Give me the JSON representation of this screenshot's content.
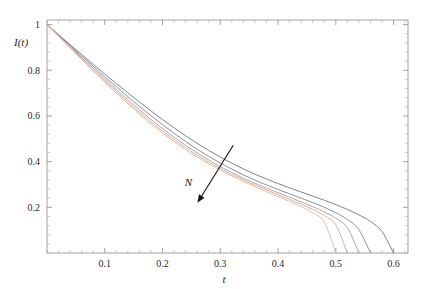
{
  "chart_data": {
    "type": "line",
    "title": "",
    "subtitle": "",
    "xlabel": "t",
    "ylabel": "I(t)",
    "xlim": [
      0,
      0.625
    ],
    "ylim": [
      0,
      1.02
    ],
    "grid": false,
    "legend": null,
    "legend_position": "none",
    "xticks": [
      0.1,
      0.2,
      0.3,
      0.4,
      0.5,
      0.6
    ],
    "xtick_labels": [
      "0.1",
      "0.2",
      "0.3",
      "0.4",
      "0.5",
      "0.6"
    ],
    "yticks": [
      0.2,
      0.4,
      0.6,
      0.8,
      1.0
    ],
    "ytick_labels": [
      "0.2",
      "0.4",
      "0.6",
      "0.8",
      "1"
    ],
    "x_minor_tick_step": 0.02,
    "y_minor_tick_step": 0.04,
    "annotations": [
      {
        "text": "N",
        "kind": "arrow-label",
        "label_x": 0.245,
        "label_y": 0.292,
        "arrow_from_x": 0.3225,
        "arrow_from_y": 0.472,
        "arrow_to_x": 0.2605,
        "arrow_to_y": 0.2195
      }
    ],
    "series": [
      {
        "name": "N-1",
        "color": "#6a7590",
        "x": [
          0,
          0.02,
          0.04,
          0.06,
          0.08,
          0.1,
          0.12,
          0.14,
          0.16,
          0.18,
          0.2,
          0.22,
          0.24,
          0.26,
          0.28,
          0.3,
          0.32,
          0.34,
          0.36,
          0.38,
          0.4,
          0.42,
          0.44,
          0.46,
          0.48,
          0.5,
          0.52,
          0.54,
          0.56,
          0.58,
          0.6
        ],
        "y": [
          1.0,
          0.956,
          0.912,
          0.869,
          0.826,
          0.784,
          0.742,
          0.701,
          0.661,
          0.622,
          0.584,
          0.548,
          0.513,
          0.48,
          0.449,
          0.42,
          0.393,
          0.368,
          0.345,
          0.324,
          0.304,
          0.285,
          0.267,
          0.249,
          0.231,
          0.212,
          0.191,
          0.167,
          0.138,
          0.094,
          0.0
        ]
      },
      {
        "name": "N-2",
        "color": "#7e8297",
        "x": [
          0,
          0.02,
          0.04,
          0.06,
          0.08,
          0.1,
          0.12,
          0.14,
          0.16,
          0.18,
          0.2,
          0.22,
          0.24,
          0.26,
          0.28,
          0.3,
          0.32,
          0.34,
          0.36,
          0.38,
          0.4,
          0.42,
          0.44,
          0.46,
          0.48,
          0.5,
          0.52,
          0.54,
          0.56
        ],
        "y": [
          1.0,
          0.954,
          0.908,
          0.862,
          0.817,
          0.772,
          0.728,
          0.684,
          0.642,
          0.601,
          0.562,
          0.524,
          0.488,
          0.454,
          0.423,
          0.394,
          0.367,
          0.342,
          0.319,
          0.298,
          0.278,
          0.259,
          0.24,
          0.221,
          0.2,
          0.176,
          0.147,
          0.102,
          0.0
        ]
      },
      {
        "name": "N-3",
        "color": "#b09a92",
        "x": [
          0,
          0.02,
          0.04,
          0.06,
          0.08,
          0.1,
          0.12,
          0.14,
          0.16,
          0.18,
          0.2,
          0.22,
          0.24,
          0.26,
          0.28,
          0.3,
          0.32,
          0.34,
          0.36,
          0.38,
          0.4,
          0.42,
          0.44,
          0.46,
          0.48,
          0.5,
          0.52,
          0.54
        ],
        "y": [
          1.0,
          0.952,
          0.904,
          0.856,
          0.809,
          0.762,
          0.716,
          0.671,
          0.627,
          0.585,
          0.545,
          0.507,
          0.471,
          0.438,
          0.407,
          0.378,
          0.352,
          0.327,
          0.305,
          0.284,
          0.264,
          0.244,
          0.224,
          0.203,
          0.18,
          0.152,
          0.111,
          0.0
        ]
      },
      {
        "name": "N-4",
        "color": "#cfa894",
        "x": [
          0,
          0.02,
          0.04,
          0.06,
          0.08,
          0.1,
          0.12,
          0.14,
          0.16,
          0.18,
          0.2,
          0.22,
          0.24,
          0.26,
          0.28,
          0.3,
          0.32,
          0.34,
          0.36,
          0.38,
          0.4,
          0.42,
          0.44,
          0.46,
          0.48,
          0.5,
          0.52
        ],
        "y": [
          1.0,
          0.95,
          0.9,
          0.851,
          0.802,
          0.754,
          0.707,
          0.661,
          0.616,
          0.574,
          0.534,
          0.496,
          0.461,
          0.428,
          0.398,
          0.37,
          0.344,
          0.32,
          0.297,
          0.276,
          0.255,
          0.235,
          0.214,
          0.191,
          0.164,
          0.123,
          0.0
        ]
      },
      {
        "name": "N-5",
        "color": "#e0b49c",
        "x": [
          0,
          0.02,
          0.04,
          0.06,
          0.08,
          0.1,
          0.12,
          0.14,
          0.16,
          0.18,
          0.2,
          0.22,
          0.24,
          0.26,
          0.28,
          0.3,
          0.32,
          0.34,
          0.36,
          0.38,
          0.4,
          0.42,
          0.44,
          0.46,
          0.48,
          0.5
        ],
        "y": [
          1.0,
          0.949,
          0.898,
          0.847,
          0.797,
          0.748,
          0.7,
          0.653,
          0.608,
          0.565,
          0.525,
          0.487,
          0.452,
          0.42,
          0.39,
          0.363,
          0.337,
          0.313,
          0.29,
          0.268,
          0.247,
          0.226,
          0.203,
          0.176,
          0.136,
          0.0
        ]
      }
    ]
  },
  "axes": {
    "ylabel_text": "I(t)",
    "xlabel_text": "t"
  },
  "annotation": {
    "n_label": "N"
  }
}
